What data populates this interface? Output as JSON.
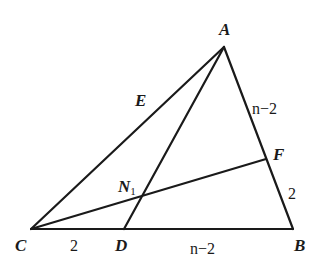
{
  "diagram": {
    "type": "geometry-triangle",
    "points": {
      "A": {
        "label": "A",
        "x": 224,
        "y": 47
      },
      "B": {
        "label": "B",
        "x": 293,
        "y": 229
      },
      "C": {
        "label": "C",
        "x": 31,
        "y": 229
      },
      "D": {
        "label": "D",
        "x": 124,
        "y": 229
      },
      "F": {
        "label": "F",
        "x": 266,
        "y": 159
      },
      "N1": {
        "label": "N",
        "subscript": "1",
        "x": 140,
        "y": 196
      },
      "E": {
        "label": "E"
      }
    },
    "segments": [
      "AB",
      "BC",
      "CA",
      "AD",
      "CF"
    ],
    "lengths": {
      "AF": "n−2",
      "FB": "2",
      "CD": "2",
      "DB": "n−2"
    }
  }
}
